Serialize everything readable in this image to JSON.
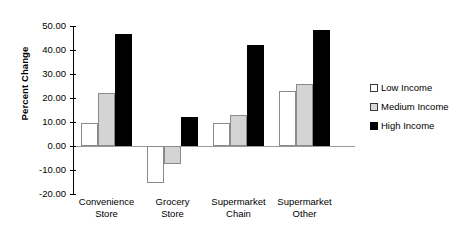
{
  "chart_data": {
    "type": "bar",
    "title": "",
    "xlabel": "",
    "ylabel": "Percent Change",
    "ylim": [
      -20.0,
      50.0
    ],
    "ytick_labels": [
      "50.00",
      "40.00",
      "30.00",
      "20.00",
      "10.00",
      "0.00",
      "-10.00",
      "-20.00"
    ],
    "ytick_values": [
      50,
      40,
      30,
      20,
      10,
      0,
      -10,
      -20
    ],
    "grid": false,
    "legend_position": "right",
    "categories": [
      "Convenience Store",
      "Grocery Store",
      "Supermarket Chain",
      "Supermarket Other"
    ],
    "category_lines": [
      [
        "Convenience",
        "Store"
      ],
      [
        "Grocery",
        "Store"
      ],
      [
        "Supermarket",
        "Chain"
      ],
      [
        "Supermarket",
        "Other"
      ]
    ],
    "series": [
      {
        "name": "Low Income",
        "color": "#ffffff",
        "values": [
          9.5,
          -15.5,
          9.5,
          23.0
        ]
      },
      {
        "name": "Medium Income",
        "color": "#d4d4d4",
        "values": [
          22.0,
          -7.5,
          12.8,
          25.8
        ]
      },
      {
        "name": "High Income",
        "color": "#000000",
        "values": [
          46.5,
          12.0,
          42.0,
          48.5
        ]
      }
    ]
  },
  "legend": {
    "items": [
      {
        "label": "Low Income"
      },
      {
        "label": "Medium Income"
      },
      {
        "label": "High Income"
      }
    ]
  },
  "axis": {
    "y_title": "Percent Change"
  }
}
